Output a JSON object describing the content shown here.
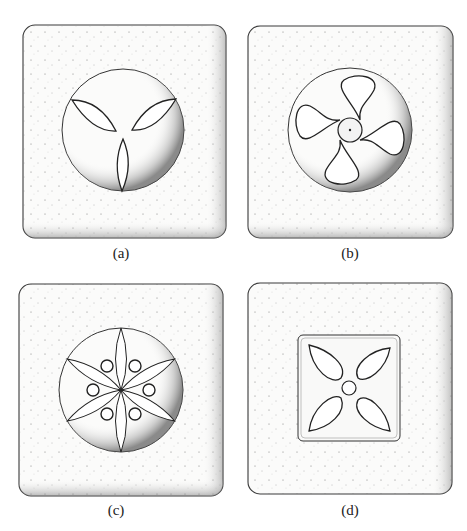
{
  "figure": {
    "panels": [
      {
        "id": "a",
        "label": "(a)",
        "motif": "circle with three almond-shaped leaves (tri-lobed)"
      },
      {
        "id": "b",
        "label": "(b)",
        "motif": "circle with four curved pinwheel blades around central boss"
      },
      {
        "id": "c",
        "label": "(c)",
        "motif": "circle with six-petal rosette and six small bosses"
      },
      {
        "id": "d",
        "label": "(d)",
        "motif": "inner square with four teardrop leaves around small central circle"
      }
    ]
  },
  "colors": {
    "background": "#ffffff",
    "tile_fill": "#fbfbfa",
    "outline": "#3a3a3a",
    "stipple": "#555555"
  }
}
